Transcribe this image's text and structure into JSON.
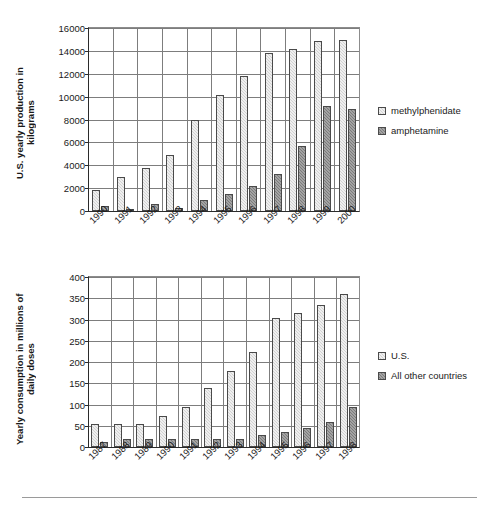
{
  "chart_data": [
    {
      "type": "bar",
      "id": "us-yearly-production",
      "title": "",
      "xlabel": "",
      "ylabel": "U.S. yearly production in kilograms",
      "ylabel_lines": [
        "U.S. yearly production in",
        "kilograms"
      ],
      "ylim": [
        0,
        16000
      ],
      "ytick_step": 2000,
      "yticks": [
        "0",
        "2000",
        "4000",
        "6000",
        "8000",
        "10000",
        "12000",
        "14000",
        "16000"
      ],
      "grid": true,
      "legend_position": "right",
      "categories": [
        "1990",
        "1991",
        "1992",
        "1993",
        "1994",
        "1995",
        "1996",
        "1997",
        "1998",
        "1999",
        "2000"
      ],
      "series": [
        {
          "name": "methylphenidate",
          "color": "#d2d2d2",
          "values": [
            1800,
            2950,
            3800,
            4900,
            7950,
            10150,
            11800,
            13800,
            14200,
            14900,
            14950
          ]
        },
        {
          "name": "amphetamine",
          "color": "#7b7b7b",
          "values": [
            450,
            60,
            650,
            220,
            1000,
            1450,
            2150,
            3200,
            5650,
            9200,
            8950
          ]
        }
      ]
    },
    {
      "type": "bar",
      "id": "yearly-consumption",
      "title": "",
      "xlabel": "",
      "ylabel": "Yearly consumption in millions of daily doses",
      "ylabel_lines": [
        "Yearly consumption in millions",
        "of daily doses"
      ],
      "ylim": [
        0,
        400
      ],
      "ytick_step": 50,
      "yticks": [
        "0",
        "50",
        "100",
        "150",
        "200",
        "250",
        "300",
        "350",
        "400"
      ],
      "grid": true,
      "legend_position": "right",
      "categories": [
        "1987",
        "1988",
        "1989",
        "1990",
        "1991",
        "1992",
        "1993",
        "1994",
        "1995",
        "1996",
        "1997",
        "1998"
      ],
      "series": [
        {
          "name": "U.S.",
          "color": "#d2d2d2",
          "values": [
            55,
            55,
            55,
            74,
            94,
            139,
            179,
            224,
            303,
            315,
            335,
            359
          ]
        },
        {
          "name": "All other countries",
          "color": "#7b7b7b",
          "values": [
            11,
            19,
            19,
            19,
            19,
            19,
            19,
            29,
            36,
            45,
            58,
            95
          ]
        }
      ]
    }
  ]
}
